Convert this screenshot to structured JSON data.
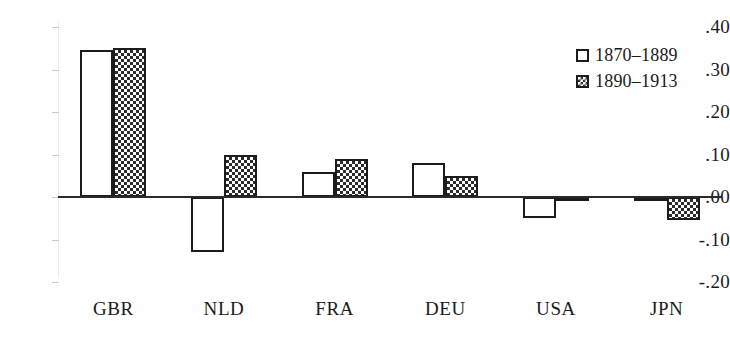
{
  "chart_data": {
    "type": "bar",
    "title": "",
    "subtitle": "",
    "xlabel": "",
    "ylabel": "",
    "categories": [
      "GBR",
      "NLD",
      "FRA",
      "DEU",
      "USA",
      "JPN"
    ],
    "series": [
      {
        "name": "1870–1889",
        "fill": "open",
        "values": [
          0.345,
          -0.13,
          0.06,
          0.08,
          -0.05,
          -0.005
        ]
      },
      {
        "name": "1890–1913",
        "fill": "checker",
        "values": [
          0.35,
          0.1,
          0.09,
          0.05,
          -0.01,
          -0.055
        ]
      }
    ],
    "ylim": [
      -0.2,
      0.4
    ],
    "yticks": [
      0.4,
      0.3,
      0.2,
      0.1,
      0.0,
      -0.1,
      -0.2
    ],
    "ytick_labels": [
      ".40",
      ".30",
      ".20",
      ".10",
      ".00",
      "-.10",
      "-.20"
    ],
    "grid": false,
    "zero_line": true,
    "legend_position": "top-right",
    "colors": {
      "bar_outline": "#1c1c1c",
      "open_fill": "#ffffff",
      "checker_fill": "#2b2b2b",
      "axis": "#ececec",
      "zero_line": "#2a2a2a",
      "text": "#1a1a1a",
      "background": "#ffffff"
    }
  },
  "axis": {
    "y_ticks": [
      {
        "label": ".40",
        "value": 0.4
      },
      {
        "label": ".30",
        "value": 0.3
      },
      {
        "label": ".20",
        "value": 0.2
      },
      {
        "label": ".10",
        "value": 0.1
      },
      {
        "label": ".00",
        "value": 0.0
      },
      {
        "label": "-.10",
        "value": -0.1
      },
      {
        "label": "-.20",
        "value": -0.2
      }
    ],
    "x_ticks": [
      {
        "label": "GBR"
      },
      {
        "label": "NLD"
      },
      {
        "label": "FRA"
      },
      {
        "label": "DEU"
      },
      {
        "label": "USA"
      },
      {
        "label": "JPN"
      }
    ]
  },
  "legend": {
    "entries": [
      {
        "label": "1870–1889",
        "fill": "open"
      },
      {
        "label": "1890–1913",
        "fill": "checker"
      }
    ]
  }
}
